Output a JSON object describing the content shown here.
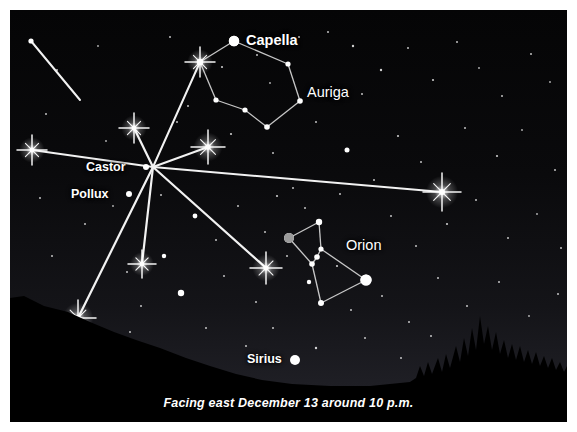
{
  "figure": {
    "caption": "Facing east December 13 around 10 p.m.",
    "frame_color": "#ffffff",
    "sky_color": "#000000",
    "horizon_color": "#000000",
    "star_color": "#ffffff",
    "meteor_color": "#f2f2f2",
    "constellation_line_color": "#dcdcdc"
  },
  "labels": [
    {
      "name": "capella",
      "text": "Capella",
      "x": 236,
      "y": 22,
      "size": 14.5,
      "weight": "bold"
    },
    {
      "name": "auriga",
      "text": "Auriga",
      "x": 297,
      "y": 74,
      "size": 14.5,
      "weight": "normal"
    },
    {
      "name": "castor",
      "text": "Castor",
      "x": 76,
      "y": 150,
      "size": 12.5,
      "weight": "bold"
    },
    {
      "name": "pollux",
      "text": "Pollux",
      "x": 61,
      "y": 177,
      "size": 12.5,
      "weight": "bold"
    },
    {
      "name": "orion",
      "text": "Orion",
      "x": 336,
      "y": 227,
      "size": 14.5,
      "weight": "normal"
    },
    {
      "name": "sirius",
      "text": "Sirius",
      "x": 237,
      "y": 342,
      "size": 12.5,
      "weight": "bold"
    }
  ],
  "named_stars": [
    {
      "name": "capella",
      "x": 224,
      "y": 31,
      "r": 5.2,
      "color": "#ffffff"
    },
    {
      "name": "castor",
      "x": 136,
      "y": 157,
      "r": 3.0,
      "color": "#ffffff"
    },
    {
      "name": "pollux",
      "x": 119,
      "y": 184,
      "r": 3.0,
      "color": "#ffffff"
    },
    {
      "name": "sirius",
      "x": 285,
      "y": 350,
      "r": 5.0,
      "color": "#ffffff"
    },
    {
      "name": "betelgeuse",
      "x": 279,
      "y": 228,
      "r": 5.0,
      "color": "#9b9b9b"
    },
    {
      "name": "rigel",
      "x": 356,
      "y": 270,
      "r": 5.6,
      "color": "#ffffff"
    }
  ],
  "constellations": [
    {
      "name": "auriga",
      "label": "Auriga",
      "nodes": [
        {
          "x": 224,
          "y": 31,
          "r": 5.2
        },
        {
          "x": 190,
          "y": 52,
          "r": 3.2
        },
        {
          "x": 206,
          "y": 90,
          "r": 2.6
        },
        {
          "x": 235,
          "y": 100,
          "r": 2.6
        },
        {
          "x": 257,
          "y": 117,
          "r": 2.8
        },
        {
          "x": 290,
          "y": 91,
          "r": 2.8
        },
        {
          "x": 278,
          "y": 54,
          "r": 2.6
        }
      ],
      "edges": [
        [
          0,
          1
        ],
        [
          1,
          2
        ],
        [
          2,
          3
        ],
        [
          3,
          4
        ],
        [
          4,
          5
        ],
        [
          5,
          6
        ],
        [
          6,
          0
        ]
      ]
    },
    {
      "name": "orion",
      "label": "Orion",
      "nodes": [
        {
          "x": 279,
          "y": 228,
          "r": 5.0
        },
        {
          "x": 309,
          "y": 212,
          "r": 3.2
        },
        {
          "x": 311,
          "y": 239,
          "r": 2.6
        },
        {
          "x": 307,
          "y": 247,
          "r": 2.8
        },
        {
          "x": 302,
          "y": 254,
          "r": 2.8
        },
        {
          "x": 356,
          "y": 270,
          "r": 5.6
        },
        {
          "x": 311,
          "y": 293,
          "r": 3.0
        },
        {
          "x": 299,
          "y": 272,
          "r": 2.2
        }
      ],
      "edges": [
        [
          0,
          1
        ],
        [
          0,
          4
        ],
        [
          1,
          2
        ],
        [
          2,
          3
        ],
        [
          3,
          4
        ],
        [
          2,
          5
        ],
        [
          4,
          6
        ],
        [
          6,
          5
        ]
      ]
    }
  ],
  "radiant": {
    "name": "geminid-radiant",
    "x": 143,
    "y": 157
  },
  "meteors": [
    {
      "name": "meteor-top-left",
      "x1": 21,
      "y1": 31,
      "x2": 70,
      "y2": 90,
      "width": 2.0,
      "flare": null,
      "flare_size": 0
    },
    {
      "name": "meteor-upper-auriga",
      "x1": 143,
      "y1": 157,
      "x2": 190,
      "y2": 52,
      "width": 2.0,
      "flare": "end",
      "flare_size": 15
    },
    {
      "name": "meteor-up",
      "x1": 143,
      "y1": 157,
      "x2": 124,
      "y2": 118,
      "width": 2.2,
      "flare": "end",
      "flare_size": 15
    },
    {
      "name": "meteor-upper-right",
      "x1": 143,
      "y1": 157,
      "x2": 198,
      "y2": 137,
      "width": 2.0,
      "flare": "end",
      "flare_size": 17
    },
    {
      "name": "meteor-left-long",
      "x1": 143,
      "y1": 157,
      "x2": 22,
      "y2": 140,
      "width": 2.0,
      "flare": "end",
      "flare_size": 15
    },
    {
      "name": "meteor-right-long",
      "x1": 143,
      "y1": 157,
      "x2": 432,
      "y2": 182,
      "width": 2.0,
      "flare": "end",
      "flare_size": 19
    },
    {
      "name": "meteor-down-vertical",
      "x1": 143,
      "y1": 157,
      "x2": 132,
      "y2": 254,
      "width": 2.2,
      "flare": "end",
      "flare_size": 14
    },
    {
      "name": "meteor-lower-right",
      "x1": 143,
      "y1": 157,
      "x2": 256,
      "y2": 258,
      "width": 2.2,
      "flare": "end",
      "flare_size": 16
    },
    {
      "name": "meteor-lower-left",
      "x1": 143,
      "y1": 157,
      "x2": 68,
      "y2": 308,
      "width": 2.2,
      "flare": "end",
      "flare_size": 18
    }
  ],
  "field_stars": [
    {
      "x": 47,
      "y": 60,
      "r": 1.0
    },
    {
      "x": 88,
      "y": 36,
      "r": 0.9
    },
    {
      "x": 160,
      "y": 27,
      "r": 1.0
    },
    {
      "x": 178,
      "y": 96,
      "r": 1.0
    },
    {
      "x": 212,
      "y": 57,
      "r": 1.1
    },
    {
      "x": 247,
      "y": 45,
      "r": 1.0
    },
    {
      "x": 260,
      "y": 73,
      "r": 0.9
    },
    {
      "x": 289,
      "y": 27,
      "r": 1.0
    },
    {
      "x": 318,
      "y": 22,
      "r": 1.0
    },
    {
      "x": 343,
      "y": 36,
      "r": 1.2
    },
    {
      "x": 352,
      "y": 84,
      "r": 1.0
    },
    {
      "x": 371,
      "y": 60,
      "r": 1.2
    },
    {
      "x": 398,
      "y": 38,
      "r": 1.0
    },
    {
      "x": 423,
      "y": 70,
      "r": 1.1
    },
    {
      "x": 447,
      "y": 32,
      "r": 1.0
    },
    {
      "x": 469,
      "y": 58,
      "r": 0.9
    },
    {
      "x": 492,
      "y": 86,
      "r": 1.0
    },
    {
      "x": 521,
      "y": 44,
      "r": 1.0
    },
    {
      "x": 540,
      "y": 72,
      "r": 0.9
    },
    {
      "x": 36,
      "y": 104,
      "r": 1.0
    },
    {
      "x": 96,
      "y": 131,
      "r": 0.9
    },
    {
      "x": 167,
      "y": 112,
      "r": 1.0
    },
    {
      "x": 221,
      "y": 124,
      "r": 1.1
    },
    {
      "x": 263,
      "y": 143,
      "r": 1.0
    },
    {
      "x": 337,
      "y": 140,
      "r": 2.5
    },
    {
      "x": 306,
      "y": 112,
      "r": 1.0
    },
    {
      "x": 388,
      "y": 126,
      "r": 1.1
    },
    {
      "x": 411,
      "y": 152,
      "r": 1.0
    },
    {
      "x": 455,
      "y": 118,
      "r": 1.0
    },
    {
      "x": 487,
      "y": 146,
      "r": 1.1
    },
    {
      "x": 512,
      "y": 120,
      "r": 0.9
    },
    {
      "x": 545,
      "y": 160,
      "r": 1.0
    },
    {
      "x": 30,
      "y": 188,
      "r": 1.0
    },
    {
      "x": 75,
      "y": 214,
      "r": 1.0
    },
    {
      "x": 103,
      "y": 196,
      "r": 0.9
    },
    {
      "x": 151,
      "y": 185,
      "r": 1.0
    },
    {
      "x": 185,
      "y": 206,
      "r": 2.4
    },
    {
      "x": 206,
      "y": 230,
      "r": 1.0
    },
    {
      "x": 228,
      "y": 196,
      "r": 1.0
    },
    {
      "x": 267,
      "y": 186,
      "r": 1.1
    },
    {
      "x": 295,
      "y": 198,
      "r": 1.0
    },
    {
      "x": 330,
      "y": 184,
      "r": 1.0
    },
    {
      "x": 381,
      "y": 206,
      "r": 1.0
    },
    {
      "x": 406,
      "y": 236,
      "r": 1.0
    },
    {
      "x": 437,
      "y": 214,
      "r": 1.1
    },
    {
      "x": 466,
      "y": 190,
      "r": 1.0
    },
    {
      "x": 498,
      "y": 228,
      "r": 1.0
    },
    {
      "x": 527,
      "y": 204,
      "r": 0.9
    },
    {
      "x": 551,
      "y": 238,
      "r": 1.0
    },
    {
      "x": 42,
      "y": 246,
      "r": 1.0
    },
    {
      "x": 117,
      "y": 262,
      "r": 1.0
    },
    {
      "x": 154,
      "y": 246,
      "r": 2.2
    },
    {
      "x": 171,
      "y": 283,
      "r": 3.2
    },
    {
      "x": 214,
      "y": 266,
      "r": 1.0
    },
    {
      "x": 246,
      "y": 292,
      "r": 1.0
    },
    {
      "x": 277,
      "y": 246,
      "r": 1.0
    },
    {
      "x": 327,
      "y": 256,
      "r": 1.1
    },
    {
      "x": 341,
      "y": 300,
      "r": 1.0
    },
    {
      "x": 372,
      "y": 286,
      "r": 1.0
    },
    {
      "x": 399,
      "y": 312,
      "r": 1.0
    },
    {
      "x": 428,
      "y": 268,
      "r": 1.0
    },
    {
      "x": 457,
      "y": 296,
      "r": 1.0
    },
    {
      "x": 489,
      "y": 272,
      "r": 1.0
    },
    {
      "x": 519,
      "y": 306,
      "r": 0.9
    },
    {
      "x": 548,
      "y": 284,
      "r": 1.0
    },
    {
      "x": 61,
      "y": 312,
      "r": 1.0
    },
    {
      "x": 120,
      "y": 322,
      "r": 1.0
    },
    {
      "x": 196,
      "y": 318,
      "r": 1.0
    },
    {
      "x": 236,
      "y": 336,
      "r": 1.0
    },
    {
      "x": 263,
      "y": 318,
      "r": 1.0
    },
    {
      "x": 306,
      "y": 338,
      "r": 1.2
    },
    {
      "x": 355,
      "y": 328,
      "r": 1.0
    },
    {
      "x": 391,
      "y": 348,
      "r": 1.0
    },
    {
      "x": 421,
      "y": 326,
      "r": 1.0
    },
    {
      "x": 131,
      "y": 296,
      "r": 1.0
    },
    {
      "x": 255,
      "y": 222,
      "r": 1.0
    },
    {
      "x": 283,
      "y": 178,
      "r": 1.0
    },
    {
      "x": 364,
      "y": 170,
      "r": 1.0
    }
  ],
  "horizon": {
    "left_hill": "M0,412 L0,288 L14,286 L34,296 L58,302 L80,312 L104,322 L126,330 L150,338 L176,348 L200,356 L226,364 L252,370 L282,374 L320,376 L360,376 L400,372 L420,368 L440,362 L460,358 L480,356 L500,354 L520,356 L540,360 L557,362 L557,412 Z",
    "right_trees": "M400,412 L400,372 L406,368 L410,356 L414,366 L418,352 L422,364 L428,348 L432,362 L436,344 L440,358 L446,336 L450,352 L454,328 L458,346 L462,318 L466,340 L470,306 L474,334 L478,316 L482,340 L486,322 L490,344 L494,330 L498,348 L502,334 L506,350 L510,336 L514,352 L518,340 L522,354 L526,342 L530,356 L534,346 L538,358 L542,348 L546,360 L550,352 L554,362 L557,356 L557,412 Z"
  }
}
